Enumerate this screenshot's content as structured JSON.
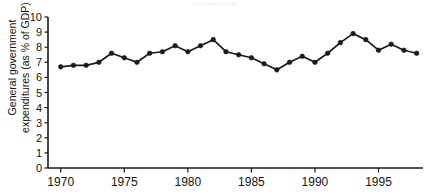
{
  "page": {
    "header_text": "International"
  },
  "chart_data": {
    "type": "line",
    "title": "",
    "subtitle": "",
    "xlabel": "",
    "ylabel": "General government\nexpenditures (as % of GDP)",
    "xlim": [
      1969,
      1998.5
    ],
    "ylim": [
      0,
      10
    ],
    "grid": false,
    "legend": null,
    "marker": "filled-circle",
    "line_color": "#1a1a1a",
    "marker_color": "#1a1a1a",
    "x_ticks": [
      1970,
      1975,
      1980,
      1985,
      1990,
      1995
    ],
    "x_tick_labels": [
      "1970",
      "1975",
      "1980",
      "1985",
      "1990",
      "1995"
    ],
    "y_ticks": [
      0,
      1,
      2,
      3,
      4,
      5,
      6,
      7,
      8,
      9,
      10
    ],
    "y_tick_labels": [
      "0",
      "1",
      "2",
      "3",
      "4",
      "5",
      "6",
      "7",
      "8",
      "9",
      "10"
    ],
    "x": [
      1970,
      1971,
      1972,
      1973,
      1974,
      1975,
      1976,
      1977,
      1978,
      1979,
      1980,
      1981,
      1982,
      1983,
      1984,
      1985,
      1986,
      1987,
      1988,
      1989,
      1990,
      1991,
      1992,
      1993,
      1994,
      1995,
      1996,
      1997,
      1998
    ],
    "values": [
      6.7,
      6.8,
      6.8,
      7.0,
      7.6,
      7.3,
      7.0,
      7.6,
      7.7,
      8.1,
      7.7,
      8.1,
      8.5,
      7.7,
      7.5,
      7.3,
      6.9,
      6.5,
      7.0,
      7.4,
      7.0,
      7.6,
      8.3,
      8.9,
      8.5,
      7.8,
      8.2,
      7.8,
      7.6
    ],
    "series": [
      {
        "name": "General government expenditures",
        "values": [
          6.7,
          6.8,
          6.8,
          7.0,
          7.6,
          7.3,
          7.0,
          7.6,
          7.7,
          8.1,
          7.7,
          8.1,
          8.5,
          7.7,
          7.5,
          7.3,
          6.9,
          6.5,
          7.0,
          7.4,
          7.0,
          7.6,
          8.3,
          8.9,
          8.5,
          7.8,
          8.2,
          7.8,
          7.6
        ]
      }
    ]
  }
}
